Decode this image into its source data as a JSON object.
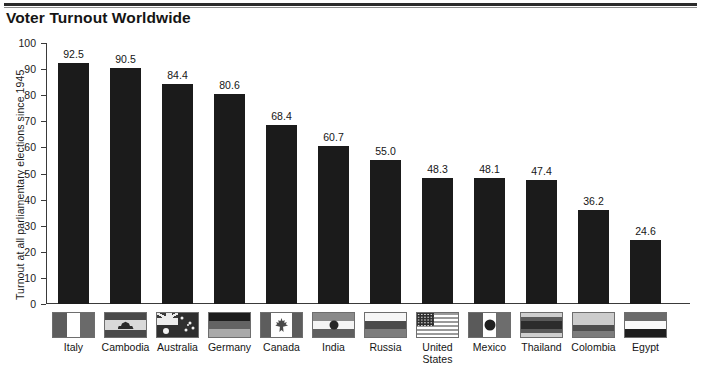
{
  "header": {
    "title": "Voter Turnout Worldwide"
  },
  "chart_data": {
    "type": "bar",
    "title": "Voter Turnout Worldwide",
    "xlabel": "",
    "ylabel": "Turnout at all parliamentary elections since 1945",
    "ylim": [
      0,
      100
    ],
    "yticks": [
      0,
      10,
      20,
      30,
      40,
      50,
      60,
      70,
      80,
      90,
      100
    ],
    "grid": false,
    "legend": "none",
    "bar_color": "#1b1b1b",
    "categories": [
      "Italy",
      "Cambodia",
      "Australia",
      "Germany",
      "Canada",
      "India",
      "Russia",
      "United States",
      "Mexico",
      "Thailand",
      "Colombia",
      "Egypt"
    ],
    "values": [
      92.5,
      90.5,
      84.4,
      80.6,
      68.4,
      60.7,
      55.0,
      48.3,
      48.1,
      47.4,
      36.2,
      24.6
    ],
    "value_labels": [
      "92.5",
      "90.5",
      "84.4",
      "80.6",
      "68.4",
      "60.7",
      "55.0",
      "48.3",
      "48.1",
      "47.4",
      "36.2",
      "24.6"
    ],
    "category_label_lines": [
      [
        "Italy"
      ],
      [
        "Cambodia"
      ],
      [
        "Australia"
      ],
      [
        "Germany"
      ],
      [
        "Canada"
      ],
      [
        "India"
      ],
      [
        "Russia"
      ],
      [
        "United",
        "States"
      ],
      [
        "Mexico"
      ],
      [
        "Thailand"
      ],
      [
        "Colombia"
      ],
      [
        "Egypt"
      ]
    ],
    "flags": [
      "flag-italy",
      "flag-cambodia",
      "flag-australia",
      "flag-germany",
      "flag-canada",
      "flag-india",
      "flag-russia",
      "flag-united-states",
      "flag-mexico",
      "flag-thailand",
      "flag-colombia",
      "flag-egypt"
    ]
  }
}
